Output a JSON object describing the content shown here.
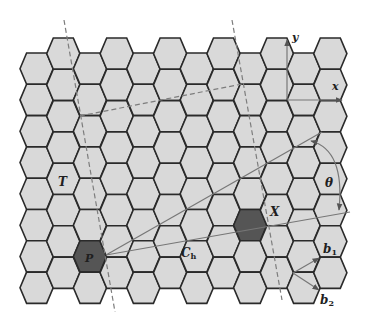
{
  "figure": {
    "width": 368,
    "height": 321,
    "colors": {
      "background": "#ffffff",
      "hex_fill": "#d9d9d9",
      "hex_stroke": "#2a2a2a",
      "hex_highlight": "#555555",
      "line": "#777777",
      "dash": "#7d7d7d",
      "text": "#1f1f1f"
    }
  },
  "lattice": {
    "columns": 12,
    "rows": 8,
    "origin_x": 20,
    "col_pitch": 26.7,
    "hex_width": 33.2,
    "slant": 6.6,
    "row_pitch": 31.3,
    "even_col_top": 53,
    "odd_col_top": 38,
    "highlighted": [
      {
        "col": 2,
        "row": 6,
        "label": "P"
      },
      {
        "col": 8,
        "row": 5,
        "label": "X"
      }
    ]
  },
  "labels": {
    "T": "T",
    "P": "P",
    "X": "X",
    "Ch_main": "C",
    "Ch_sub": "h",
    "theta": "θ",
    "x_axis": "x",
    "y_axis": "y",
    "b1_main": "b",
    "b1_sub": "1",
    "b2_main": "b",
    "b2_sub": "2"
  },
  "vectors": {
    "chiral_vector_Ch": {
      "from": [
        106,
        255
      ],
      "to": [
        350,
        212
      ]
    },
    "translation_line": {
      "from": [
        106,
        255
      ],
      "to": [
        322,
        132
      ]
    },
    "b1": {
      "from": [
        293,
        273
      ],
      "to": [
        319,
        258
      ]
    },
    "b2": {
      "from": [
        293,
        273
      ],
      "to": [
        319,
        290
      ]
    },
    "x_axis": {
      "from": [
        287,
        100
      ],
      "to": [
        342,
        100
      ]
    },
    "y_axis": {
      "from": [
        287,
        100
      ],
      "to": [
        287,
        40
      ]
    },
    "theta_arc": {
      "from": [
        311,
        141
      ],
      "to": [
        339,
        210
      ]
    }
  },
  "dashed_lines": [
    {
      "name": "left-boundary",
      "from": [
        64,
        20
      ],
      "to": [
        115,
        312
      ]
    },
    {
      "name": "right-boundary",
      "from": [
        232,
        20
      ],
      "to": [
        282,
        300
      ]
    },
    {
      "name": "top-boundary",
      "from": [
        80,
        116
      ],
      "to": [
        242,
        84
      ]
    }
  ]
}
